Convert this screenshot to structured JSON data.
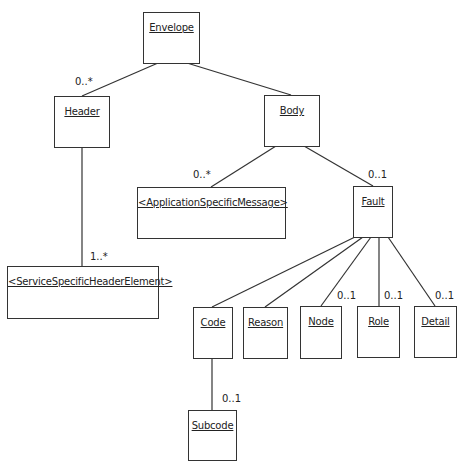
{
  "diagram": {
    "type": "UML class hierarchy",
    "nodes": [
      {
        "id": "envelope",
        "label": "Envelope"
      },
      {
        "id": "header",
        "label": "Header"
      },
      {
        "id": "body",
        "label": "Body"
      },
      {
        "id": "app_msg",
        "label": "<ApplicationSpecificMessage>"
      },
      {
        "id": "fault",
        "label": "Fault"
      },
      {
        "id": "svc_header",
        "label": "<ServiceSpecificHeaderElement>"
      },
      {
        "id": "code",
        "label": "Code"
      },
      {
        "id": "reason",
        "label": "Reason"
      },
      {
        "id": "node",
        "label": "Node"
      },
      {
        "id": "role",
        "label": "Role"
      },
      {
        "id": "detail",
        "label": "Detail"
      },
      {
        "id": "subcode",
        "label": "Subcode"
      }
    ],
    "edges": [
      {
        "from": "envelope",
        "to": "header",
        "multiplicity": "0..*"
      },
      {
        "from": "envelope",
        "to": "body",
        "multiplicity": ""
      },
      {
        "from": "header",
        "to": "svc_header",
        "multiplicity": "1..*"
      },
      {
        "from": "body",
        "to": "app_msg",
        "multiplicity": "0..*"
      },
      {
        "from": "body",
        "to": "fault",
        "multiplicity": "0..1"
      },
      {
        "from": "fault",
        "to": "code",
        "multiplicity": ""
      },
      {
        "from": "fault",
        "to": "reason",
        "multiplicity": ""
      },
      {
        "from": "fault",
        "to": "node",
        "multiplicity": "0..1"
      },
      {
        "from": "fault",
        "to": "role",
        "multiplicity": "0..1"
      },
      {
        "from": "fault",
        "to": "detail",
        "multiplicity": "0..1"
      },
      {
        "from": "code",
        "to": "subcode",
        "multiplicity": "0..1"
      }
    ]
  }
}
